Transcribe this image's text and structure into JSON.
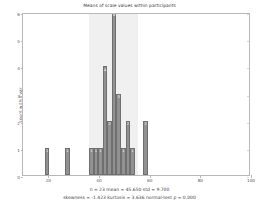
{
  "chart_data": {
    "type": "bar",
    "title": "Means of scale values within participants",
    "xlabel": "",
    "ylabel": "count within var",
    "xlim": [
      10,
      100
    ],
    "ylim": [
      0,
      6
    ],
    "xticks": [
      20,
      40,
      60,
      80,
      100
    ],
    "yticks": [
      0,
      1,
      2,
      3,
      4,
      5,
      6
    ],
    "grid": false,
    "legend": null,
    "bin_width": 1.8,
    "bars": [
      {
        "x": 19.5,
        "value": 1,
        "label": "1"
      },
      {
        "x": 27.5,
        "value": 1,
        "label": "1"
      },
      {
        "x": 37.0,
        "value": 1,
        "label": "1"
      },
      {
        "x": 38.8,
        "value": 1,
        "label": "1"
      },
      {
        "x": 40.6,
        "value": 1,
        "label": "1"
      },
      {
        "x": 42.4,
        "value": 4,
        "label": "4"
      },
      {
        "x": 44.2,
        "value": 2,
        "label": "2"
      },
      {
        "x": 46.0,
        "value": 6,
        "label": "6"
      },
      {
        "x": 47.8,
        "value": 3,
        "label": "3"
      },
      {
        "x": 49.6,
        "value": 1,
        "label": "1"
      },
      {
        "x": 51.4,
        "value": 2,
        "label": "2"
      },
      {
        "x": 53.2,
        "value": 1,
        "label": "1"
      },
      {
        "x": 58.4,
        "value": 2,
        "label": "2"
      }
    ],
    "std_band": {
      "start": 35.95,
      "end": 55.35
    },
    "annotations": {
      "line1": "n = 23 mean = 45.650 std = 9.700",
      "line2": "skewness = -1.423 kurtosis = 3.636 normal-test p = 0.000"
    },
    "stats": {
      "n": 23,
      "mean": 45.65,
      "std": 9.7,
      "skewness": -1.423,
      "kurtosis": 3.636,
      "normal_test_p": 0.0
    }
  },
  "colors": {
    "bar_fill": "#919191",
    "bar_edge": "#6f6f6f",
    "band": "#f0f0f0",
    "axis": "#b8b8b8",
    "text": "#3f3f3f",
    "background": "#ffffff"
  }
}
